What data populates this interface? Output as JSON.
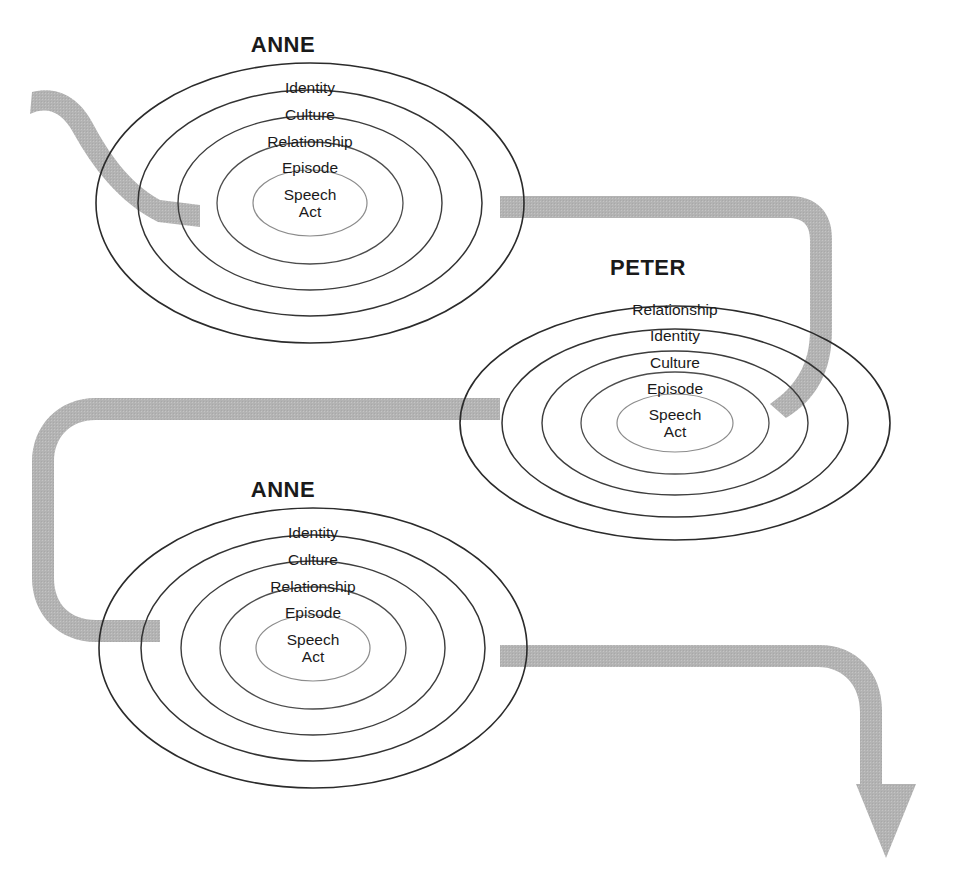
{
  "figure": {
    "background_color": "#ffffff",
    "ribbon_color": "#b3b3b3",
    "outline_color": "#2b2b2b",
    "inner_outline_color": "#8c8c8c",
    "text_color": "#1a1a1a"
  },
  "groups": [
    {
      "id": "anne-top",
      "title": "ANNE",
      "rings": [
        {
          "label": "Identity"
        },
        {
          "label": "Culture"
        },
        {
          "label": "Relationship"
        },
        {
          "label": "Episode"
        },
        {
          "label": "Speech Act",
          "line1": "Speech",
          "line2": "Act"
        }
      ]
    },
    {
      "id": "peter-middle",
      "title": "PETER",
      "rings": [
        {
          "label": "Relationship"
        },
        {
          "label": "Identity"
        },
        {
          "label": "Culture"
        },
        {
          "label": "Episode"
        },
        {
          "label": "Speech Act",
          "line1": "Speech",
          "line2": "Act"
        }
      ]
    },
    {
      "id": "anne-bottom",
      "title": "ANNE",
      "rings": [
        {
          "label": "Identity"
        },
        {
          "label": "Culture"
        },
        {
          "label": "Relationship"
        },
        {
          "label": "Episode"
        },
        {
          "label": "Speech Act",
          "line1": "Speech",
          "line2": "Act"
        }
      ]
    }
  ],
  "flow": {
    "direction": "serpentine",
    "arrow_position": "bottom-right",
    "segments": [
      "start-top-left",
      "anne-top-to-peter",
      "peter-to-anne-bottom",
      "anne-bottom-to-arrow"
    ]
  }
}
